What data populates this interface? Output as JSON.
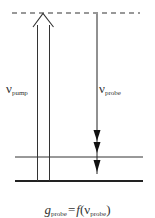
{
  "diagram": {
    "type": "energy-level-diagram",
    "levels": [
      {
        "name": "virtual-level",
        "style": "dashed",
        "y": 13
      },
      {
        "name": "intermediate-level",
        "style": "solid",
        "y": 157
      },
      {
        "name": "ground-level",
        "style": "solid-thick",
        "y": 181
      }
    ],
    "pump": {
      "symbol": "ν",
      "subscript": "pump",
      "direction": "up"
    },
    "probe": {
      "symbol": "ν",
      "subscript": "probe",
      "direction": "down",
      "arrowheads": 3
    },
    "formula": {
      "lhs": "g",
      "lhs_sub": "probe",
      "eq": "=",
      "func": "f",
      "open": "(",
      "arg": "ν",
      "arg_sub": "probe",
      "close": ")"
    }
  }
}
